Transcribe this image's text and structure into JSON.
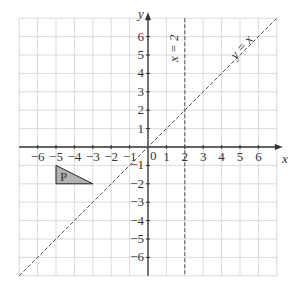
{
  "chart_data": {
    "type": "diagram",
    "title": "",
    "xlabel": "x",
    "ylabel": "y",
    "xlim": [
      -7,
      7
    ],
    "ylim": [
      -7,
      7
    ],
    "grid": true,
    "x_ticks": [
      "−6",
      "−5",
      "−4",
      "−3",
      "−2",
      "−1",
      "1",
      "2",
      "3",
      "4",
      "5",
      "6"
    ],
    "x_tick_values": [
      -6,
      -5,
      -4,
      -3,
      -2,
      -1,
      1,
      2,
      3,
      4,
      5,
      6
    ],
    "y_ticks": [
      "6",
      "5",
      "4",
      "3",
      "2",
      "1",
      "−1",
      "−2",
      "−3",
      "−4",
      "−5",
      "−6"
    ],
    "y_tick_values": [
      6,
      5,
      4,
      3,
      2,
      1,
      -1,
      -2,
      -3,
      -4,
      -5,
      -6
    ],
    "origin_label": "0",
    "lines": [
      {
        "label": "x = 2",
        "type": "vertical",
        "x": 2,
        "style": "dashed"
      },
      {
        "label": "y = x",
        "type": "diagonal",
        "slope": 1,
        "intercept": 0,
        "style": "dashed"
      }
    ],
    "shapes": [
      {
        "label": "P",
        "type": "triangle",
        "vertices": [
          [
            -5,
            -1
          ],
          [
            -5,
            -2
          ],
          [
            -3,
            -2
          ]
        ],
        "fill": "#b0b0b0"
      }
    ]
  },
  "labels": {
    "x_axis": "x",
    "y_axis": "y",
    "origin": "0",
    "line_x2": "x = 2",
    "line_yx": "y = x",
    "shape_p": "P"
  },
  "colors": {
    "grid": "#cfcfcf",
    "axis": "#333333",
    "dashed": "#555555",
    "shape_fill": "#b3b3b3"
  }
}
